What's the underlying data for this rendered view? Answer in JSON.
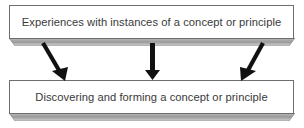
{
  "diagram": {
    "type": "flow",
    "top_box": {
      "label": "Experiences with instances of a concept or principle"
    },
    "bottom_box": {
      "label": "Discovering and forming a concept or principle"
    },
    "arrows": [
      {
        "name": "left-arrow",
        "direction": "down-right"
      },
      {
        "name": "center-arrow",
        "direction": "down"
      },
      {
        "name": "right-arrow",
        "direction": "down-left"
      }
    ],
    "colors": {
      "box_border": "#6e6e6e",
      "text": "#3a3a3a",
      "arrow": "#111111",
      "bevel_light": "#d9d9d9",
      "bevel_dark": "#8a8a8a"
    }
  }
}
